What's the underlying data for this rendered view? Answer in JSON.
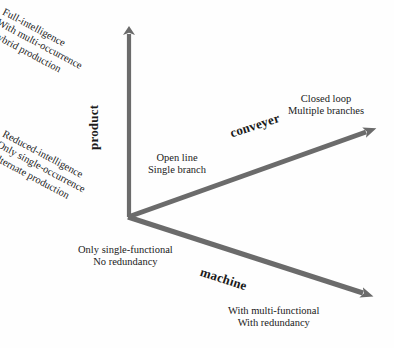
{
  "figure": {
    "type": "3-axis-concept-diagram",
    "background_color": "#fefefe",
    "axis_color": "#6b6b6b",
    "text_color": "#1a1a1a",
    "origin": {
      "x": 128,
      "y": 217
    }
  },
  "axes": {
    "product": {
      "name": "product",
      "direction": "up",
      "tip": {
        "x": 129,
        "y": 22
      },
      "low_end": {
        "line1": "Reduced-intelligence",
        "line2": "Only single-occurrence",
        "line3": "Alternate production"
      },
      "high_end": {
        "line1": "Full-intelligence",
        "line2": "With multi-occurrence",
        "line3": "Hybrid production"
      }
    },
    "conveyer": {
      "name": "conveyer",
      "direction": "up-right",
      "tip": {
        "x": 378,
        "y": 128
      },
      "low_end": {
        "line1": "Open line",
        "line2": "Single branch"
      },
      "high_end": {
        "line1": "Closed loop",
        "line2": "Multiple branches"
      }
    },
    "machine": {
      "name": "machine",
      "direction": "down-right",
      "tip": {
        "x": 376,
        "y": 297
      },
      "low_end": {
        "line1": "Only single-functional",
        "line2": "No redundancy"
      },
      "high_end": {
        "line1": "With multi-functional",
        "line2": "With redundancy"
      }
    }
  }
}
